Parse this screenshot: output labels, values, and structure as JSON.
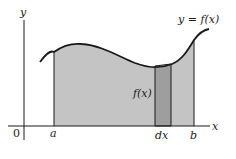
{
  "diagram": {
    "curve_label": "y = f(x)",
    "strip_height_label": "f(x)",
    "axis_labels": {
      "x": "x",
      "y": "y"
    },
    "tick_labels": {
      "origin": "0",
      "a": "a",
      "dx": "dx",
      "b": "b"
    },
    "colors": {
      "region_fill": "#c4c4c4",
      "strip_fill": "#9e9e9e",
      "stroke": "#1a1a1a",
      "background": "#ffffff"
    }
  }
}
